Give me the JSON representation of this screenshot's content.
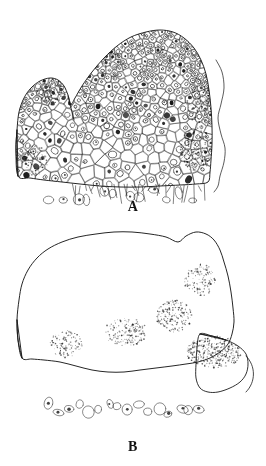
{
  "figure": {
    "type": "scientific-line-drawing",
    "background_color": "#ffffff",
    "ink_color": "#1a1a1a",
    "width": 266,
    "height": 466,
    "panels": [
      {
        "id": "A",
        "label": "A",
        "label_y": 205,
        "bounds": {
          "x": 0,
          "y": 0,
          "width": 266,
          "height": 200
        },
        "description": "Dome-shaped apical meristem with a smaller lateral primordium on the left flank and a detached outer membrane line along the right margin.",
        "outline": [
          [
            18,
            176
          ],
          [
            16,
            150
          ],
          [
            17,
            130
          ],
          [
            19,
            112
          ],
          [
            24,
            98
          ],
          [
            31,
            88
          ],
          [
            40,
            81
          ],
          [
            50,
            78
          ],
          [
            58,
            80
          ],
          [
            64,
            86
          ],
          [
            68,
            95
          ],
          [
            71,
            104
          ],
          [
            75,
            98
          ],
          [
            82,
            86
          ],
          [
            92,
            72
          ],
          [
            104,
            58
          ],
          [
            117,
            46
          ],
          [
            131,
            37
          ],
          [
            146,
            32
          ],
          [
            160,
            30
          ],
          [
            173,
            32
          ],
          [
            184,
            38
          ],
          [
            194,
            48
          ],
          [
            201,
            60
          ],
          [
            206,
            74
          ],
          [
            209,
            90
          ],
          [
            211,
            108
          ],
          [
            212,
            126
          ],
          [
            212,
            144
          ],
          [
            211,
            160
          ],
          [
            210,
            172
          ],
          [
            208,
            182
          ],
          [
            196,
            184
          ],
          [
            180,
            185
          ],
          [
            160,
            186
          ],
          [
            140,
            187
          ],
          [
            120,
            187
          ],
          [
            100,
            186
          ],
          [
            80,
            184
          ],
          [
            62,
            182
          ],
          [
            44,
            180
          ],
          [
            30,
            178
          ]
        ],
        "lateral_primordium": {
          "side": "left",
          "apex": [
            48,
            79
          ],
          "notch": [
            71,
            104
          ]
        },
        "membrane_line": [
          [
            216,
            60
          ],
          [
            222,
            72
          ],
          [
            224,
            88
          ],
          [
            221,
            104
          ],
          [
            218,
            118
          ],
          [
            221,
            134
          ],
          [
            225,
            148
          ],
          [
            224,
            162
          ],
          [
            220,
            176
          ],
          [
            218,
            186
          ],
          [
            214,
            192
          ]
        ],
        "dark_patches": [
          {
            "cx": 100,
            "cy": 54,
            "rx": 18,
            "ry": 14,
            "density": 0.85
          },
          {
            "cx": 52,
            "cy": 92,
            "rx": 16,
            "ry": 13,
            "density": 0.8
          },
          {
            "cx": 196,
            "cy": 150,
            "rx": 16,
            "ry": 22,
            "density": 0.7
          },
          {
            "cx": 200,
            "cy": 104,
            "rx": 13,
            "ry": 20,
            "density": 0.6
          },
          {
            "cx": 34,
            "cy": 160,
            "rx": 14,
            "ry": 16,
            "density": 0.55
          }
        ],
        "cell_zones": [
          {
            "name": "tunica",
            "cell_size": 5.0
          },
          {
            "name": "corpus",
            "cell_size": 7.5
          },
          {
            "name": "rib-meristem",
            "cell_size": 11.0
          }
        ],
        "basal_fringe_y": 186
      },
      {
        "id": "B",
        "label": "B",
        "label_y": 443,
        "bounds": {
          "x": 0,
          "y": 228,
          "width": 266,
          "height": 210
        },
        "description": "Broader, flatter apical meristem with a prominent lateral primordium on the right flank and large vacuolate pith cells below.",
        "outline": [
          [
            22,
            358
          ],
          [
            18,
            340
          ],
          [
            17,
            320
          ],
          [
            19,
            300
          ],
          [
            22,
            284
          ],
          [
            28,
            270
          ],
          [
            37,
            258
          ],
          [
            48,
            249
          ],
          [
            62,
            242
          ],
          [
            78,
            237
          ],
          [
            96,
            234
          ],
          [
            114,
            232
          ],
          [
            132,
            232
          ],
          [
            150,
            234
          ],
          [
            166,
            237
          ],
          [
            178,
            242
          ],
          [
            186,
            236
          ],
          [
            196,
            232
          ],
          [
            206,
            234
          ],
          [
            214,
            240
          ],
          [
            220,
            250
          ],
          [
            224,
            262
          ],
          [
            228,
            276
          ],
          [
            231,
            292
          ],
          [
            233,
            308
          ],
          [
            234,
            322
          ],
          [
            232,
            334
          ],
          [
            228,
            344
          ],
          [
            220,
            352
          ],
          [
            210,
            358
          ],
          [
            198,
            362
          ],
          [
            186,
            364
          ],
          [
            172,
            366
          ],
          [
            156,
            368
          ],
          [
            140,
            370
          ],
          [
            124,
            372
          ],
          [
            108,
            372
          ],
          [
            92,
            370
          ],
          [
            76,
            366
          ],
          [
            60,
            362
          ],
          [
            44,
            360
          ],
          [
            32,
            359
          ]
        ],
        "lateral_primordium": {
          "side": "right",
          "apex": [
            246,
            352
          ],
          "base_upper": [
            206,
            336
          ],
          "base_lower": [
            216,
            382
          ],
          "tip_hook": [
            250,
            392
          ]
        },
        "dark_patches": [
          {
            "cx": 214,
            "cy": 352,
            "rx": 28,
            "ry": 16,
            "density": 0.88
          },
          {
            "cx": 174,
            "cy": 316,
            "rx": 18,
            "ry": 16,
            "density": 0.72
          },
          {
            "cx": 126,
            "cy": 332,
            "rx": 22,
            "ry": 14,
            "density": 0.62
          },
          {
            "cx": 66,
            "cy": 344,
            "rx": 16,
            "ry": 14,
            "density": 0.58
          },
          {
            "cx": 200,
            "cy": 280,
            "rx": 16,
            "ry": 16,
            "density": 0.55
          }
        ],
        "cell_zones": [
          {
            "name": "tunica",
            "cell_size": 5.5
          },
          {
            "name": "corpus",
            "cell_size": 7.0
          },
          {
            "name": "pith",
            "cell_size": 13.0
          }
        ],
        "basal_fringe_y": 400
      }
    ]
  }
}
